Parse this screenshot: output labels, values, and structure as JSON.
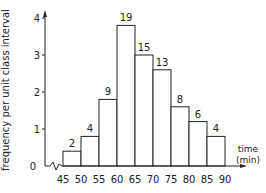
{
  "chart_data": {
    "type": "bar",
    "title": "",
    "xlabel": "time (min)",
    "xlabel_line1": "time",
    "xlabel_line2": "(min)",
    "ylabel": "frequency per unit class interval",
    "x_ticks": [
      "45",
      "50",
      "55",
      "60",
      "65",
      "70",
      "75",
      "80",
      "85",
      "90"
    ],
    "y_ticks": [
      "0",
      "1",
      "2",
      "3",
      "4"
    ],
    "ylim": [
      0,
      4
    ],
    "categories": [
      "45-50",
      "50-55",
      "55-60",
      "60-65",
      "65-70",
      "70-75",
      "75-80",
      "80-85",
      "85-90"
    ],
    "frequencies": [
      2,
      4,
      9,
      19,
      15,
      13,
      8,
      6,
      4
    ],
    "values": [
      0.4,
      0.8,
      1.8,
      3.8,
      3.0,
      2.6,
      1.6,
      1.2,
      0.8
    ],
    "bar_labels": [
      "2",
      "4",
      "9",
      "19",
      "15",
      "13",
      "8",
      "6",
      "4"
    ],
    "grid": false
  }
}
